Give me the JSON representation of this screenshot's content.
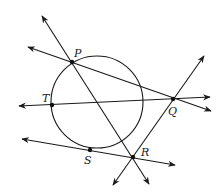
{
  "figure": {
    "colors": {
      "stroke": "#1a1a1a",
      "point": "#111111",
      "background": "#ffffff"
    },
    "circle": {
      "cx": 97,
      "cy": 102,
      "r": 46
    },
    "points": [
      {
        "id": "P",
        "label": "P",
        "x": 72,
        "y": 62,
        "lx": 74,
        "ly": 57
      },
      {
        "id": "Q",
        "label": "Q",
        "x": 173,
        "y": 99,
        "lx": 168,
        "ly": 115
      },
      {
        "id": "T",
        "label": "T",
        "x": 52,
        "y": 105,
        "lx": 42,
        "ly": 102
      },
      {
        "id": "S",
        "label": "S",
        "x": 90,
        "y": 150,
        "lx": 84,
        "ly": 164
      },
      {
        "id": "R",
        "label": "R",
        "x": 133,
        "y": 157,
        "lx": 141,
        "ly": 156
      }
    ],
    "lines": [
      {
        "name": "line-PR",
        "x1": 42,
        "y1": 16,
        "x2": 149,
        "y2": 184,
        "arrows": "both"
      },
      {
        "name": "line-PQ",
        "x1": 28,
        "y1": 47,
        "x2": 211,
        "y2": 111,
        "arrows": "both"
      },
      {
        "name": "line-TQ",
        "x1": 19,
        "y1": 106,
        "x2": 210,
        "y2": 97,
        "arrows": "both"
      },
      {
        "name": "line-SR",
        "x1": 22,
        "y1": 139,
        "x2": 175,
        "y2": 165,
        "arrows": "both"
      },
      {
        "name": "line-QR",
        "x1": 113,
        "y1": 185,
        "x2": 204,
        "y2": 56,
        "arrows": "both"
      }
    ]
  }
}
